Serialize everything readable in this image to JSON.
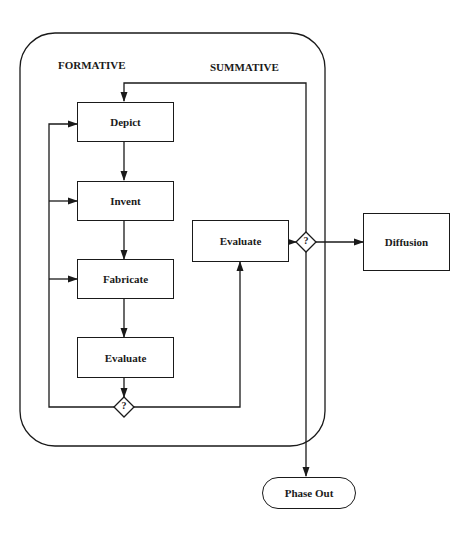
{
  "diagram": {
    "section_labels": {
      "formative": "FORMATIVE",
      "summative": "SUMMATIVE"
    },
    "formative_steps": [
      {
        "id": "depict",
        "label": "Depict"
      },
      {
        "id": "invent",
        "label": "Invent"
      },
      {
        "id": "fabricate",
        "label": "Fabricate"
      },
      {
        "id": "evaluate",
        "label": "Evaluate"
      }
    ],
    "summative_step": {
      "id": "summative-evaluate",
      "label": "Evaluate"
    },
    "decisions": [
      {
        "id": "formative-decision",
        "label": "?"
      },
      {
        "id": "summative-decision",
        "label": "?"
      }
    ],
    "outcomes": {
      "diffusion": "Diffusion",
      "phase_out": "Phase Out"
    },
    "edges": [
      {
        "from": "depict",
        "to": "invent"
      },
      {
        "from": "invent",
        "to": "fabricate"
      },
      {
        "from": "fabricate",
        "to": "evaluate"
      },
      {
        "from": "evaluate",
        "to": "formative-decision"
      },
      {
        "from": "formative-decision",
        "to": "depict"
      },
      {
        "from": "formative-decision",
        "to": "invent"
      },
      {
        "from": "formative-decision",
        "to": "fabricate"
      },
      {
        "from": "formative-decision",
        "to": "summative-evaluate"
      },
      {
        "from": "summative-evaluate",
        "to": "summative-decision"
      },
      {
        "from": "summative-decision",
        "to": "depict"
      },
      {
        "from": "summative-decision",
        "to": "diffusion"
      },
      {
        "from": "summative-decision",
        "to": "phase-out"
      }
    ]
  }
}
